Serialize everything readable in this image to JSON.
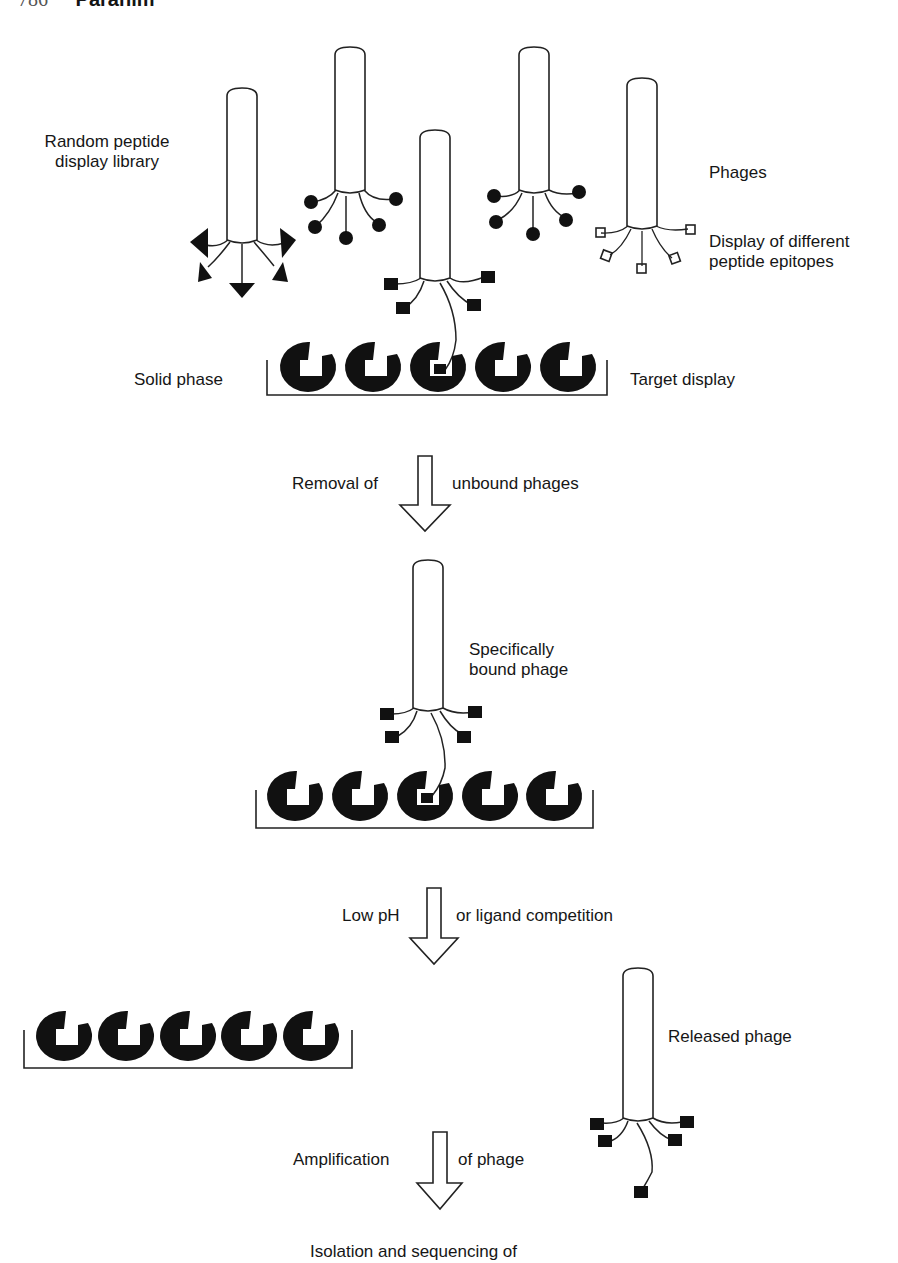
{
  "header": {
    "page_number": "786",
    "author": "Paraním"
  },
  "labels": {
    "library_line1": "Random peptide",
    "library_line2": "display library",
    "phages": "Phages",
    "epitopes_line1": "Display of different",
    "epitopes_line2": "peptide epitopes",
    "solid_phase": "Solid phase",
    "target_display": "Target display",
    "step1_left": "Removal of",
    "step1_right": "unbound phages",
    "bound_line1": "Specifically",
    "bound_line2": "bound phage",
    "step2_left": "Low pH",
    "step2_right": "or ligand competition",
    "released": "Released phage",
    "step3_left": "Amplification",
    "step3_right": "of phage",
    "final": "Isolation and sequencing of"
  },
  "colors": {
    "ink": "#111111",
    "background": "#ffffff"
  },
  "icons": {
    "phage": "filamentous-phage-icon",
    "epitope_triangle": "triangle-epitope-icon",
    "epitope_circle": "circle-epitope-icon",
    "epitope_square": "square-epitope-icon",
    "epitope_star": "star-epitope-icon",
    "target": "crescent-target-icon",
    "arrow": "hollow-down-arrow-icon"
  }
}
